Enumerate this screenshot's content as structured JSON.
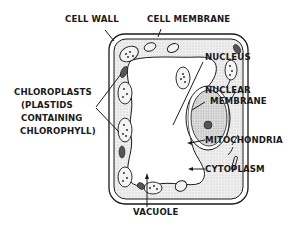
{
  "diagram": {
    "labels": {
      "cell_wall": "CELL WALL",
      "cell_membrane": "CELL MEMBRANE",
      "nucleus": "NUCLEUS",
      "nuclear_membrane_1": "NUCLEAR",
      "nuclear_membrane_2": "MEMBRANE",
      "chloroplasts_1": "CHLOROPLASTS",
      "chloroplasts_2": "(PLASTIDS",
      "chloroplasts_3": "CONTAINING",
      "chloroplasts_4": "CHLOROPHYLL)",
      "mitochondria": "MITOCHONDRIA",
      "cytoplasm": "CYTOPLASM",
      "vacuole": "VACUOLE"
    },
    "colors": {
      "ink": "#1a1a1a",
      "cytoplasm_fill": "#e6e6e6",
      "nucleus_fill": "#d4d4d4",
      "background": "#ffffff"
    }
  }
}
